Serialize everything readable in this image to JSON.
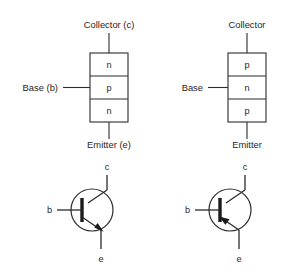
{
  "figure": {
    "background_color": "#ffffff",
    "line_color": "#2b2b2b",
    "text_color": "#1f1f1f"
  },
  "devices": [
    {
      "id": "npn",
      "type": "NPN",
      "structure": {
        "layers": [
          {
            "letter": "n",
            "region": "collector"
          },
          {
            "letter": "p",
            "region": "base"
          },
          {
            "letter": "n",
            "region": "emitter"
          }
        ],
        "collector_label": "Collector (c)",
        "base_label": "Base (b)",
        "emitter_label": "Emitter (e)"
      },
      "symbol": {
        "collector_pin": "c",
        "base_pin": "b",
        "emitter_pin": "e",
        "emitter_arrow_direction": "outward"
      }
    },
    {
      "id": "pnp",
      "type": "PNP",
      "structure": {
        "layers": [
          {
            "letter": "p",
            "region": "collector"
          },
          {
            "letter": "n",
            "region": "base"
          },
          {
            "letter": "p",
            "region": "emitter"
          }
        ],
        "collector_label": "Collector",
        "base_label": "Base",
        "emitter_label": "Emitter"
      },
      "symbol": {
        "collector_pin": "c",
        "base_pin": "b",
        "emitter_pin": "e",
        "emitter_arrow_direction": "inward"
      }
    }
  ]
}
